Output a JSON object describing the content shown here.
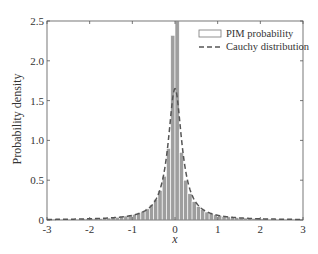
{
  "chart_data": {
    "type": "bar",
    "title": "",
    "xlabel": "x",
    "ylabel": "Probability density",
    "xlim": [
      -3,
      3
    ],
    "ylim": [
      0,
      2.5
    ],
    "xticks": [
      -3,
      -2,
      -1,
      0,
      1,
      2,
      3
    ],
    "xtick_labels": [
      "-3",
      "-2",
      "-1",
      "0",
      "1",
      "2",
      "3"
    ],
    "yticks": [
      0,
      0.5,
      1.0,
      1.5,
      2.0,
      2.5
    ],
    "ytick_labels": [
      "0",
      "0.5",
      "1.0",
      "1.5",
      "2.0",
      "2.5"
    ],
    "grid": false,
    "legend_position": "upper right",
    "series": [
      {
        "name": "PIM probability",
        "type": "bar",
        "bin_width": 0.1,
        "bin_centers": [
          -2.95,
          -2.85,
          -2.75,
          -2.65,
          -2.55,
          -2.45,
          -2.35,
          -2.25,
          -2.15,
          -2.05,
          -1.95,
          -1.85,
          -1.75,
          -1.65,
          -1.55,
          -1.45,
          -1.35,
          -1.25,
          -1.15,
          -1.05,
          -0.95,
          -0.85,
          -0.75,
          -0.65,
          -0.55,
          -0.45,
          -0.35,
          -0.25,
          -0.15,
          -0.05,
          0.05,
          0.15,
          0.25,
          0.35,
          0.45,
          0.55,
          0.65,
          0.75,
          0.85,
          0.95,
          1.05,
          1.15,
          1.25,
          1.35,
          1.45,
          1.55,
          1.65,
          1.75,
          1.85,
          1.95,
          2.05,
          2.15,
          2.25,
          2.35,
          2.45,
          2.55,
          2.65,
          2.75,
          2.85,
          2.95
        ],
        "values": [
          0.01,
          0.01,
          0.01,
          0.01,
          0.01,
          0.01,
          0.01,
          0.01,
          0.015,
          0.015,
          0.02,
          0.02,
          0.02,
          0.025,
          0.025,
          0.03,
          0.035,
          0.04,
          0.05,
          0.06,
          0.07,
          0.09,
          0.11,
          0.14,
          0.19,
          0.26,
          0.37,
          0.55,
          0.9,
          2.32,
          2.6,
          0.85,
          0.5,
          0.33,
          0.23,
          0.17,
          0.13,
          0.1,
          0.08,
          0.065,
          0.055,
          0.045,
          0.04,
          0.035,
          0.03,
          0.025,
          0.025,
          0.02,
          0.02,
          0.02,
          0.015,
          0.015,
          0.01,
          0.01,
          0.01,
          0.01,
          0.01,
          0.01,
          0.01,
          0.01
        ],
        "color": "#9e9e9e",
        "edge_color": "#ffffff"
      },
      {
        "name": "Cauchy distribution",
        "type": "line",
        "style": "dashed",
        "location": 0,
        "scale": 0.193,
        "peak": 1.65,
        "color": "#555555"
      }
    ]
  },
  "legend": {
    "items": [
      {
        "label": "PIM probability",
        "symbol": "box"
      },
      {
        "label": "Cauchy distribution",
        "symbol": "dashed-line"
      }
    ]
  },
  "axes": {
    "xlabel": "x",
    "ylabel": "Probability density"
  }
}
